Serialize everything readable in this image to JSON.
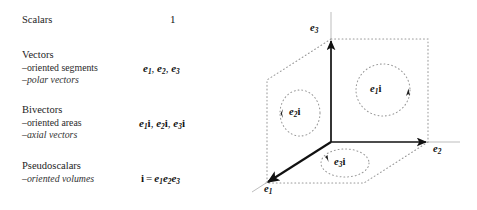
{
  "figure": {
    "title_rows": [
      {
        "name": "scalars",
        "header": "Scalars",
        "sublabels": [],
        "math_plain": "1",
        "math_parts": [
          {
            "t": "1",
            "style": "plain"
          }
        ]
      },
      {
        "name": "vectors",
        "header": "Vectors",
        "sublabels": [
          "–oriented segments",
          "–polar vectors"
        ],
        "math_plain": "e1, e2, e3",
        "math_parts": [
          {
            "t": "e",
            "sub": "1",
            "style": "bold-italic"
          },
          {
            "t": ", ",
            "style": "plain"
          },
          {
            "t": "e",
            "sub": "2",
            "style": "bold-italic"
          },
          {
            "t": ", ",
            "style": "plain"
          },
          {
            "t": "e",
            "sub": "3",
            "style": "bold-italic"
          }
        ]
      },
      {
        "name": "bivectors",
        "header": "Bivectors",
        "sublabels": [
          "–oriented areas",
          "–axial vectors"
        ],
        "math_plain": "e1i, e2i, e3i",
        "math_parts": [
          {
            "t": "e",
            "sub": "1",
            "style": "bold-italic"
          },
          {
            "t": "i",
            "style": "bold-upright"
          },
          {
            "t": ", ",
            "style": "plain"
          },
          {
            "t": "e",
            "sub": "2",
            "style": "bold-italic"
          },
          {
            "t": "i",
            "style": "bold-upright"
          },
          {
            "t": ", ",
            "style": "plain"
          },
          {
            "t": "e",
            "sub": "3",
            "style": "bold-italic"
          },
          {
            "t": "i",
            "style": "bold-upright"
          }
        ]
      },
      {
        "name": "pseudoscalars",
        "header": "Pseudoscalars",
        "sublabels": [
          "–oriented volumes"
        ],
        "math_plain": "i = e1 e2 e3",
        "math_parts": [
          {
            "t": "i",
            "style": "bold-upright"
          },
          {
            "t": "=",
            "style": "relation"
          },
          {
            "t": "e",
            "sub": "1",
            "style": "bold-italic"
          },
          {
            "t": "e",
            "sub": "2",
            "style": "bold-italic"
          },
          {
            "t": "e",
            "sub": "3",
            "style": "bold-italic"
          }
        ]
      }
    ],
    "rows_text": {
      "scalars": {
        "header": "Scalars",
        "math": "1"
      },
      "vectors": {
        "header": "Vectors",
        "sub1": "–oriented segments",
        "sub2": "–polar vectors",
        "math_e1": "e",
        "math_e1_sub": "1",
        "math_sep1": ", ",
        "math_e2": "e",
        "math_e2_sub": "2",
        "math_sep2": ", ",
        "math_e3": "e",
        "math_e3_sub": "3"
      },
      "bivectors": {
        "header": "Bivectors",
        "sub1": "–oriented areas",
        "sub2": "–axial vectors",
        "math_e1": "e",
        "math_e1_sub": "1",
        "math_i1": "i",
        "math_sep1": ", ",
        "math_e2": "e",
        "math_e2_sub": "2",
        "math_i2": "i",
        "math_sep2": ", ",
        "math_e3": "e",
        "math_e3_sub": "3",
        "math_i3": "i"
      },
      "pseudoscalars": {
        "header": "Pseudoscalars",
        "sub1": "–oriented volumes",
        "math_i": "i",
        "math_eq": "=",
        "math_e1": "e",
        "math_e1_sub": "1",
        "math_e2": "e",
        "math_e2_sub": "2",
        "math_e3": "e",
        "math_e3_sub": "3"
      }
    },
    "diagram": {
      "axis_labels": {
        "e1": "e",
        "e1_sub": "1",
        "e2": "e",
        "e2_sub": "2",
        "e3": "e",
        "e3_sub": "3"
      },
      "loop_labels": {
        "e1i": "e",
        "e1i_sub": "1",
        "e1i_i": "i",
        "e2i": "e",
        "e2i_sub": "2",
        "e2i_i": "i",
        "e3i": "e",
        "e3i_sub": "3",
        "e3i_i": "i"
      },
      "geometry": {
        "origin": [
          81,
          142
        ],
        "e1_tip": [
          16,
          183
        ],
        "e2_tip": [
          178,
          142
        ],
        "e3_tip": [
          81,
          39
        ],
        "plane_e1i_rect": [
          [
            81,
            39
          ],
          [
            178,
            39
          ],
          [
            178,
            142
          ],
          [
            81,
            142
          ]
        ],
        "plane_e2i_quad": [
          [
            81,
            39
          ],
          [
            17,
            80
          ],
          [
            17,
            183
          ],
          [
            81,
            142
          ]
        ],
        "plane_e3i_quad": [
          [
            81,
            142
          ],
          [
            178,
            142
          ],
          [
            114,
            183
          ],
          [
            16,
            183
          ]
        ],
        "loop_e1i": {
          "cx": 133,
          "cy": 90,
          "rx": 27,
          "ry": 26
        },
        "loop_e2i": {
          "cx": 50,
          "cy": 113,
          "rx": 20,
          "ry": 23
        },
        "loop_e3i": {
          "cx": 95,
          "cy": 163,
          "rx": 24,
          "ry": 14
        }
      },
      "colors": {
        "axis": "#111111",
        "dotted": "#9a9a9a",
        "text": "#111111",
        "axis_extension": "#b5b5b5"
      }
    }
  }
}
